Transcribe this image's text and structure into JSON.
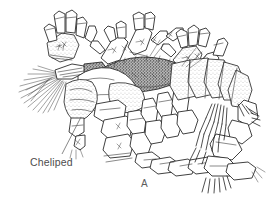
{
  "figure": {
    "kind": "scientific-line-drawing",
    "background_color": "#ffffff",
    "ink_color": "#2b2b2b",
    "label_color": "#4d4d4d",
    "panel_label": "A",
    "annotations": [
      {
        "id": "cheliped",
        "text": "Cheliped",
        "leader_from": [
          62,
          154
        ],
        "leader_to": [
          81,
          117
        ]
      }
    ],
    "parts": [
      "antennal-plume",
      "carapace",
      "cheliped",
      "maxillipeds",
      "pereopods",
      "abdominal-segments",
      "uropod-setae",
      "antennule-flagella"
    ]
  }
}
